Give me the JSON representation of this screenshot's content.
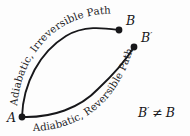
{
  "figure": {
    "name": "adiabatic-paths-diagram",
    "background_color": "#fdfdfd",
    "ink_color": "#17171a",
    "width": 190,
    "height": 136
  },
  "nodes": [
    {
      "id": "A",
      "label": "A",
      "prime": "",
      "x": 22,
      "y": 117
    },
    {
      "id": "B",
      "label": "B",
      "prime": "",
      "x": 119,
      "y": 30
    },
    {
      "id": "Bp",
      "label": "B",
      "prime": "′",
      "x": 134,
      "y": 47
    }
  ],
  "node_labels": {
    "A": "A",
    "B": "B",
    "B_prime_base": "B",
    "B_prime_mark": "′"
  },
  "paths": [
    {
      "id": "irreversible",
      "label": "Adiabatic, Irreversible Path",
      "label_part_1": "Adiabatic,",
      "label_part_2": "Irreversible Path",
      "from": "A",
      "to": "B",
      "side": "upper-left"
    },
    {
      "id": "reversible",
      "label": "Adiabatic, Reversible Path",
      "label_part_1": "Adiabatic,",
      "label_part_2": "Reversible Path",
      "from": "A",
      "to": "B'",
      "side": "lower-right"
    }
  ],
  "annotation": {
    "relation": "B′ ≠ B",
    "left_symbol": "B",
    "left_prime": "′",
    "operator": "≠",
    "right_symbol": "B",
    "x": 140,
    "y": 113
  }
}
